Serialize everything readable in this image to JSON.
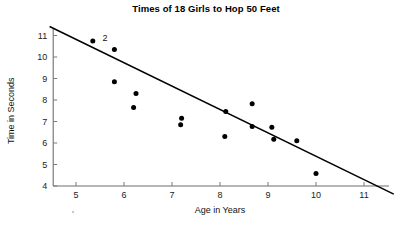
{
  "chart_data": {
    "type": "scatter",
    "title": "Times of 18 Girls to Hop 50 Feet",
    "xlabel": "Age in Years",
    "ylabel": "Time in Seconds",
    "xlim": [
      4.4,
      11.6
    ],
    "ylim": [
      4,
      11.4
    ],
    "xticks": [
      5,
      6,
      7,
      8,
      9,
      10,
      11
    ],
    "yticks": [
      4,
      5,
      6,
      7,
      8,
      9,
      10,
      11
    ],
    "grid": false,
    "legend": null,
    "points": [
      {
        "x": 5.35,
        "y": 10.75,
        "label": "2",
        "count": 2
      },
      {
        "x": 5.8,
        "y": 10.35,
        "count": 1
      },
      {
        "x": 5.8,
        "y": 8.85,
        "count": 1
      },
      {
        "x": 6.25,
        "y": 8.3,
        "count": 1
      },
      {
        "x": 6.2,
        "y": 7.65,
        "count": 1
      },
      {
        "x": 7.2,
        "y": 7.15,
        "count": 1
      },
      {
        "x": 7.18,
        "y": 6.85,
        "count": 1
      },
      {
        "x": 8.12,
        "y": 7.47,
        "count": 1
      },
      {
        "x": 8.1,
        "y": 6.3,
        "count": 1
      },
      {
        "x": 8.67,
        "y": 7.82,
        "count": 1
      },
      {
        "x": 8.67,
        "y": 6.77,
        "count": 1
      },
      {
        "x": 9.08,
        "y": 6.73,
        "count": 1
      },
      {
        "x": 9.12,
        "y": 6.18,
        "count": 1
      },
      {
        "x": 9.6,
        "y": 6.1,
        "count": 1
      },
      {
        "x": 10.0,
        "y": 4.58,
        "count": 1
      }
    ],
    "annotations": [
      {
        "text": "2",
        "x": 5.55,
        "y": 10.88,
        "note": "count label for overlapping markers"
      }
    ],
    "trend_line": {
      "x_start": 4.45,
      "y_start": 11.42,
      "x_end": 11.62,
      "y_end": 3.62,
      "type": "line-of-best-fit"
    }
  }
}
